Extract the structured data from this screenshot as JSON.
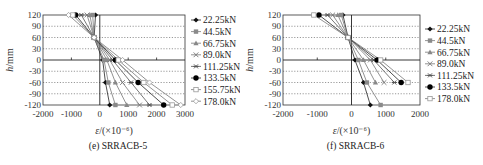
{
  "chart_data": [
    {
      "type": "line",
      "title": "(e) SRRACB-5",
      "caption_label": "(e)",
      "caption_name": "SRRACB-5",
      "xlabel": "ε/(×10⁻⁶)",
      "ylabel": "h/mm",
      "xlim": [
        -2000,
        3000
      ],
      "ylim": [
        -120,
        120
      ],
      "xticks": [
        -2000,
        -1000,
        0,
        1000,
        2000,
        3000
      ],
      "yticks": [
        120,
        90,
        60,
        30,
        0,
        -30,
        -60,
        -90,
        -120
      ],
      "grid": "horizontal dotted",
      "legend_position": "right",
      "y": [
        120,
        60,
        0,
        -60,
        -120
      ],
      "series": [
        {
          "name": "22.25kN",
          "marker": "diamond-filled",
          "values": [
            -150,
            -200,
            100,
            200,
            350
          ]
        },
        {
          "name": "44.5kN",
          "marker": "square-gray",
          "values": [
            -250,
            -200,
            150,
            300,
            550
          ]
        },
        {
          "name": "66.75kN",
          "marker": "triangle-gray",
          "values": [
            -350,
            -200,
            250,
            550,
            950
          ]
        },
        {
          "name": "89.0kN",
          "marker": "x",
          "values": [
            -450,
            -200,
            350,
            800,
            1400
          ]
        },
        {
          "name": "111.25kN",
          "marker": "asterisk",
          "values": [
            -650,
            -200,
            450,
            1100,
            1750
          ]
        },
        {
          "name": "133.5kN",
          "marker": "circle-filled",
          "values": [
            -850,
            -200,
            550,
            1350,
            2250
          ]
        },
        {
          "name": "155.75kN",
          "marker": "square-open",
          "values": [
            -950,
            -200,
            650,
            1550,
            2550
          ]
        },
        {
          "name": "178.0kN",
          "marker": "diamond-open",
          "values": [
            -1100,
            -200,
            800,
            1750,
            2850
          ]
        }
      ]
    },
    {
      "type": "line",
      "title": "(f) SRRACB-6",
      "caption_label": "(f)",
      "caption_name": "SRRACB-6",
      "xlabel": "ε/(×10⁻⁶)",
      "ylabel": "h/mm",
      "xlim": [
        -2000,
        2000
      ],
      "ylim": [
        -120,
        120
      ],
      "xticks": [
        -2000,
        -1000,
        0,
        1000,
        2000
      ],
      "yticks": [
        120,
        90,
        60,
        30,
        0,
        -30,
        -60,
        -90,
        -120
      ],
      "grid": "horizontal dotted",
      "legend_position": "right",
      "y": [
        120,
        60,
        0,
        -60,
        -120
      ],
      "series": [
        {
          "name": "22.25kN",
          "marker": "diamond-filled",
          "values": [
            -250,
            -100,
            100,
            350,
            550
          ]
        },
        {
          "name": "44.5kN",
          "marker": "square-gray",
          "values": [
            -300,
            -100,
            200,
            450,
            850
          ]
        },
        {
          "name": "66.75kN",
          "marker": "triangle-gray",
          "values": [
            -400,
            -100,
            350,
            700,
            null
          ]
        },
        {
          "name": "89.0kN",
          "marker": "x",
          "values": [
            -550,
            -100,
            550,
            950,
            null
          ]
        },
        {
          "name": "111.25kN",
          "marker": "asterisk",
          "values": [
            -700,
            -100,
            650,
            1250,
            null
          ]
        },
        {
          "name": "133.5kN",
          "marker": "circle-filled",
          "values": [
            -950,
            -100,
            750,
            1450,
            null
          ]
        },
        {
          "name": "178.0kN",
          "marker": "square-open",
          "values": [
            -1100,
            -100,
            850,
            1650,
            null
          ]
        }
      ]
    }
  ]
}
